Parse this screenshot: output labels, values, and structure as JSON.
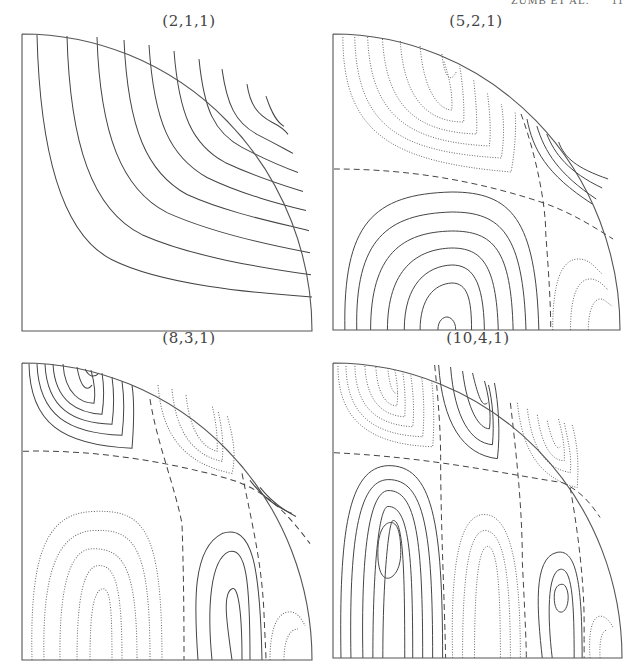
{
  "header": {
    "running_title": "ZUMB ET AL.",
    "page_number": "11"
  },
  "chart_data": [
    {
      "type": "contour",
      "title": "(2,1,1)",
      "frame": {
        "x": 22,
        "y": 34,
        "w": 290,
        "h": 297
      },
      "title_pos": {
        "x": 67,
        "y": 12
      },
      "contours": {
        "solid": [
          "M15,1 C18,120 40,200 90,225 C140,250 230,258 290,262",
          "M45,2 C48,110 70,175 120,200 C170,222 240,233 289,240",
          "M75,3 C78,100 100,155 145,178 C190,198 245,210 288,218",
          "M102,6 C106,95 125,138 165,160 C205,178 255,188 287,196",
          "M127,11 C132,88 148,122 185,143 C220,160 260,170 284,176",
          "M152,17 C157,80 170,110 203,128 C235,143 265,152 281,157",
          "M177,25 C182,75 192,98 220,113 C245,126 265,134 276,138",
          "M200,35 C205,70 213,88 235,100 C255,110 265,116 271,119",
          "M225,50 C228,70 235,80 250,88 C258,92 263,96 266,100",
          "M244,62 C250,80 255,88 262,92"
        ],
        "dotted": [],
        "dashed": []
      }
    },
    {
      "type": "contour",
      "title": "(5,2,1)",
      "frame": {
        "x": 333,
        "y": 34,
        "w": 287,
        "h": 296
      },
      "title_pos": {
        "x": 43,
        "y": 12
      },
      "contours": {
        "solid": [
          "M12,296 C10,190 40,160 120,158 C180,158 205,185 208,296",
          "M24,296 C22,205 55,180 120,178 C170,178 192,200 195,296",
          "M38,296 C38,220 70,198 120,197 C162,197 180,215 182,296",
          "M55,296 C55,235 85,215 120,214 C150,214 165,230 167,296",
          "M72,296 C72,250 95,232 120,231 C140,231 152,245 153,296",
          "M88,296 C88,265 102,250 120,249 C136,249 140,265 140,296",
          "M106,296 C106,286 112,283 115,283 C118,283 124,286 124,296",
          "M196,85 C202,115 215,140 262,170",
          "M206,92 C214,118 228,140 266,165",
          "M216,100 C224,120 238,138 272,154",
          "M228,108 C234,124 246,134 278,145"
        ],
        "dotted": [
          "M10,3 C10,100 60,128 180,138 C185,110 185,85 184,78",
          "M22,3 C24,95 70,118 170,124 C174,100 172,80 170,70",
          "M35,3 C38,85 80,108 158,112 C160,95 158,75 156,58",
          "M50,5 C54,78 90,98 145,100 C146,85 144,62 142,45",
          "M68,7 C72,70 100,88 132,88 C133,72 131,50 128,32",
          "M88,12 C92,62 110,76 120,76 C121,60 118,45 112,27",
          "M110,20 C112,40 118,52 125,37",
          "M222,296 C222,250 230,225 248,225 C260,225 266,235 272,240",
          "M240,296 C240,260 248,245 260,245 C268,245 274,252 278,256",
          "M258,296 C258,275 264,265 270,265 C275,265 278,270 282,272"
        ],
        "dashed": [
          "M1,135 C60,135 130,142 210,168 C240,178 262,192 283,205",
          "M190,80 C205,120 215,170 215,200 C218,240 220,270 220,296"
        ]
      }
    },
    {
      "type": "contour",
      "title": "(8,3,1)",
      "frame": {
        "x": 22,
        "y": 363,
        "w": 290,
        "h": 297
      },
      "title_pos": {
        "x": 67,
        "y": -18
      },
      "contours": {
        "solid": [
          "M7,1 C8,60 40,82 110,85 C112,60 112,35 110,22",
          "M15,1 C17,52 46,70 100,72 C102,55 102,32 100,18",
          "M23,1 C25,46 52,60 90,61 C92,46 92,28 90,14",
          "M31,1 C33,40 58,50 80,51 C82,38 82,22 80,10",
          "M41,1 C43,32 60,40 72,40 C74,30 72,18 69,7",
          "M55,4 C58,22 64,30 70,22",
          "M63,6 C67,14 72,15 77,10",
          "M176,296 C172,240 170,185 200,170 C230,160 238,200 240,296",
          "M190,296 C185,245 188,196 207,188 C224,184 228,215 228,296",
          "M210,296 C205,260 200,230 210,225 C215,222 220,240 220,296",
          "M228,117 C238,130 250,142 270,150",
          "M238,124 C246,134 256,144 274,153"
        ],
        "dotted": [
          "M10,296 C8,200 20,150 70,148 C120,146 140,160 140,296",
          "M22,296 C20,210 35,170 70,167 C112,165 128,180 128,296",
          "M38,296 C37,222 48,186 70,185 C100,185 115,200 115,296",
          "M55,296 C55,232 62,205 75,202 C92,200 100,218 100,296",
          "M68,296 C68,245 72,228 80,225 C88,224 90,240 90,296",
          "M136,22 C140,70 160,100 210,110 C215,90 210,70 205,52",
          "M150,26 C154,70 172,92 200,98 C202,82 200,64 196,48",
          "M164,32 C168,68 180,84 195,88 C196,75 194,58 190,42",
          "M248,296 C248,265 255,248 268,248 C275,248 280,255 283,262",
          "M262,296 C262,275 268,265 276,265"
        ],
        "dashed": [
          "M1,88 C70,86 145,98 205,115 C240,125 262,145 288,180",
          "M128,36 C135,80 152,120 160,160 C162,220 162,270 162,296",
          "M220,110 C230,160 240,200 242,250 C243,275 244,290 244,296"
        ]
      }
    },
    {
      "type": "contour",
      "title": "(10,4,1)",
      "frame": {
        "x": 333,
        "y": 363,
        "w": 289,
        "h": 295
      },
      "title_pos": {
        "x": 45,
        "y": -18
      },
      "contours": {
        "solid": [
          "M8,296 C6,170 15,105 55,103 C100,102 110,160 110,296",
          "M18,296 C16,180 25,118 55,117 C92,116 100,170 100,296",
          "M30,296 C28,192 36,130 55,128 C84,127 90,180 90,296",
          "M40,296 C40,205 46,145 55,144 C76,143 80,190 80,296",
          "M50,296 C50,215 56,160 60,158 C70,157 72,200 72,296",
          "M45,190 C45,168 52,160 58,160 C66,160 68,175 68,190 C68,208 60,216 55,216 C48,216 45,205 45,190",
          "M106,2 C110,60 130,92 165,96 C168,70 166,40 162,20",
          "M118,4 C122,55 138,80 160,82 C162,60 160,38 156,22",
          "M130,8 C135,48 147,66 157,66 C159,50 156,32 152,18",
          "M140,10 C146,35 150,45 155,40",
          "M210,296 C205,250 200,195 225,190 C245,186 250,225 250,296",
          "M220,296 C215,255 215,210 228,207 C240,205 242,240 242,296",
          "M222,235 C222,225 226,222 230,222 C234,222 236,230 236,235 C236,245 232,250 229,250 C225,250 222,245 222,235"
        ],
        "dotted": [
          "M5,3 C5,60 40,82 100,84 C102,60 101,35 99,18",
          "M13,3 C14,56 45,72 90,74 C92,52 91,30 89,15",
          "M22,3 C23,50 50,62 80,64 C82,46 80,26 78,12",
          "M32,3 C34,44 55,53 72,54 C73,40 72,22 70,9",
          "M43,4 C45,38 58,43 64,43 C66,32 64,16 62,7",
          "M55,5 C57,28 62,32 65,30",
          "M185,40 C190,85 205,115 245,125 C247,100 245,80 240,62",
          "M195,46 C200,85 212,105 238,110 C240,95 236,78 232,60",
          "M205,52 C210,85 220,98 232,98 C233,85 230,70 226,55",
          "M215,58 C220,80 225,88 228,84",
          "M120,296 C118,210 125,155 150,152 C180,150 188,210 188,296",
          "M130,296 C130,220 135,170 152,168 C172,168 178,215 178,296",
          "M142,296 C142,230 145,185 155,184 C165,184 168,225 168,296",
          "M258,296 C256,270 260,255 268,254 C274,254 278,260 281,265",
          "M268,296 C267,278 270,268 275,268"
        ],
        "dashed": [
          "M1,90 C100,95 165,110 230,120 C248,128 258,140 268,155",
          "M102,2 C106,40 108,70 108,95 C108,160 112,240 113,296",
          "M178,40 C185,100 190,150 190,200 C192,240 194,280 194,296",
          "M238,125 C246,170 252,220 252,260 C252,280 252,292 252,296"
        ]
      }
    }
  ]
}
